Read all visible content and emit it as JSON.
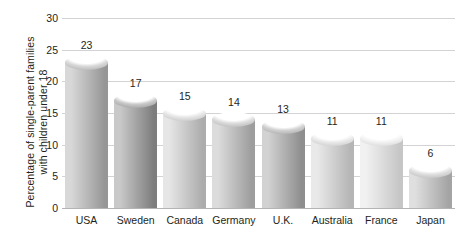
{
  "chart_data": {
    "type": "bar",
    "title": "",
    "xlabel": "",
    "ylabel_lines": [
      "Percentage of single-parent families",
      "with children under 18"
    ],
    "ylabel": "Percentage of single-parent families with children under 18",
    "categories": [
      "USA",
      "Sweden",
      "Canada",
      "Germany",
      "U.K.",
      "Australia",
      "France",
      "Japan"
    ],
    "values": [
      23,
      17,
      15,
      14,
      13,
      11,
      11,
      6
    ],
    "value_labels": [
      "23",
      "17",
      "15",
      "14",
      "13",
      "11",
      "11",
      "6"
    ],
    "ylim": [
      0,
      30
    ],
    "yticks": [
      0,
      5,
      10,
      15,
      20,
      25,
      30
    ],
    "ytick_labels": [
      "0",
      "5",
      "10",
      "15",
      "20",
      "25",
      "30"
    ],
    "grid": true,
    "legend": "none",
    "bar_style": "cylinder-3d",
    "bar_colors": [
      {
        "category": "USA",
        "light": "#d8d8d8",
        "dark": "#969696"
      },
      {
        "category": "Sweden",
        "light": "#c9c9c9",
        "dark": "#7d7d7d"
      },
      {
        "category": "Canada",
        "light": "#e6e6e6",
        "dark": "#acacac"
      },
      {
        "category": "Germany",
        "light": "#dcdcdc",
        "dark": "#9d9d9d"
      },
      {
        "category": "U.K.",
        "light": "#d2d2d2",
        "dark": "#8e8e8e"
      },
      {
        "category": "Australia",
        "light": "#e9e9e9",
        "dark": "#b5b5b5"
      },
      {
        "category": "France",
        "light": "#f1f1f1",
        "dark": "#c6c6c6"
      },
      {
        "category": "Japan",
        "light": "#dfdfdf",
        "dark": "#a4a4a4"
      }
    ],
    "grid_color": "#d3d3d5",
    "axis_color": "#b4b4b6",
    "text_color": "#231f20",
    "background": "#ffffff"
  }
}
